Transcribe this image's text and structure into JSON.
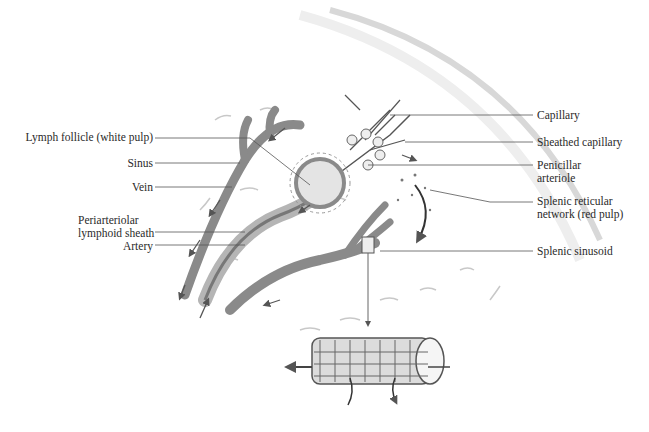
{
  "diagram": {
    "labels_left": [
      {
        "id": "lymph-follicle",
        "text": "Lymph follicle (white pulp)"
      },
      {
        "id": "sinus",
        "text": "Sinus"
      },
      {
        "id": "vein",
        "text": "Vein"
      },
      {
        "id": "pals_line1",
        "text": "Periarteriolar"
      },
      {
        "id": "pals_line2",
        "text": "lymphoid sheath"
      },
      {
        "id": "artery",
        "text": "Artery"
      }
    ],
    "labels_right": [
      {
        "id": "capillary",
        "text": "Capillary"
      },
      {
        "id": "sheathed-capillary",
        "text": "Sheathed capillary"
      },
      {
        "id": "penicillar_line1",
        "text": "Penicillar"
      },
      {
        "id": "penicillar_line2",
        "text": "arteriole"
      },
      {
        "id": "red-pulp_line1",
        "text": "Splenic reticular"
      },
      {
        "id": "red-pulp_line2",
        "text": "network (red pulp)"
      },
      {
        "id": "splenic-sinusoid",
        "text": "Splenic sinusoid"
      }
    ],
    "colors": {
      "line": "#555555",
      "vessel": "#8a8a8a",
      "vessel_dark": "#555555",
      "background": "#ffffff"
    }
  }
}
